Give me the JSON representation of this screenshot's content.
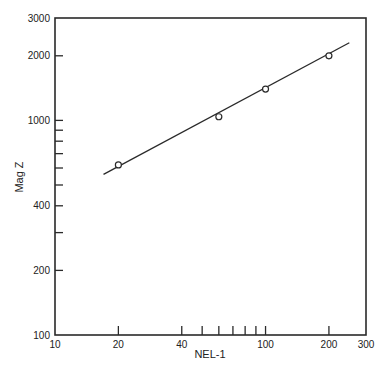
{
  "chart_data": {
    "type": "line",
    "title": "",
    "xlabel": "NEL-1",
    "ylabel": "Mag Z",
    "xscale": "log",
    "yscale": "log",
    "xlim": [
      10,
      300
    ],
    "ylim": [
      100,
      3000
    ],
    "x_tick_labels": [
      "10",
      "20",
      "40",
      "100",
      "200",
      "300"
    ],
    "x_ticks": [
      10,
      20,
      40,
      50,
      60,
      70,
      80,
      90,
      100,
      200,
      300
    ],
    "y_tick_labels": [
      "100",
      "200",
      "400",
      "1000",
      "2000",
      "3000"
    ],
    "y_ticks": [
      100,
      200,
      300,
      400,
      500,
      600,
      700,
      800,
      900,
      1000,
      2000,
      3000
    ],
    "grid": false,
    "legend": null,
    "series": [
      {
        "name": "measured",
        "marker": "open-circle",
        "x": [
          20,
          60,
          100,
          200
        ],
        "y": [
          620,
          1040,
          1400,
          2000
        ]
      }
    ],
    "fit_line": {
      "x": [
        17,
        250
      ],
      "y": [
        560,
        2300
      ]
    }
  }
}
